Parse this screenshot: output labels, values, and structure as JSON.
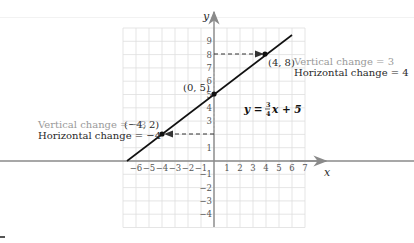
{
  "chart_data": {
    "type": "line",
    "title": "",
    "equation": "y = (3/4)x + 5",
    "equation_display": {
      "lhs": "y = ",
      "num": "3",
      "den": "4",
      "rhs": "x + 5"
    },
    "xlabel": "x",
    "ylabel": "y",
    "xlim": [
      -7,
      7
    ],
    "ylim": [
      -5,
      10
    ],
    "grid": true,
    "x_ticks": [
      -6,
      -5,
      -4,
      -3,
      -2,
      -1,
      1,
      2,
      3,
      4,
      5,
      6,
      7
    ],
    "y_ticks": [
      -4,
      -3,
      -2,
      -1,
      1,
      2,
      3,
      4,
      5,
      6,
      7,
      8,
      9
    ],
    "series": [
      {
        "name": "y = 3/4 x + 5",
        "slope": 0.75,
        "intercept": 5,
        "x": [
          -6.667,
          6
        ],
        "y": [
          0,
          9.5
        ]
      }
    ],
    "points": [
      {
        "label": "(0, 5)",
        "x": 0,
        "y": 5
      },
      {
        "label": "(4, 8)",
        "x": 4,
        "y": 8
      },
      {
        "label": "(−4, 2)",
        "x": -4,
        "y": 2
      }
    ],
    "annotations": [
      {
        "text": "Vertical change = 3",
        "color": "#9a9a9a"
      },
      {
        "text": "Horizontal change = 4",
        "color": "#2a2a2a"
      },
      {
        "text": "Vertical change = −3",
        "color": "#9a9a9a"
      },
      {
        "text": "Horizontal change = −4",
        "color": "#2a2a2a"
      }
    ],
    "legend": null
  },
  "labels": {
    "x_axis": "x",
    "y_axis": "y",
    "pt_0_5": "(0, 5)",
    "pt_4_8": "(4, 8)",
    "pt_m4_2": "(−4, 2)",
    "vert_pos": "Vertical change = 3",
    "horiz_pos": "Horizontal change = 4",
    "vert_neg": "Vertical change = −3",
    "horiz_neg": "Horizontal change = −4",
    "eq_lhs": "y = ",
    "eq_num": "3",
    "eq_den": "4",
    "eq_rhs": "x + 5",
    "xt": [
      "−6",
      "−5",
      "−4",
      "−3",
      "−2",
      "−1",
      "1",
      "2",
      "3",
      "4",
      "5",
      "6",
      "7"
    ],
    "yt": [
      "9",
      "8",
      "7",
      "6",
      "5",
      "4",
      "3",
      "1",
      "−1",
      "−2",
      "−3",
      "−4"
    ]
  },
  "colors": {
    "axis": "#8a8a8a",
    "grid": "#dcdcdc",
    "line": "#111111",
    "gray_text": "#9a9a9a",
    "dark_text": "#2a2a2a"
  }
}
